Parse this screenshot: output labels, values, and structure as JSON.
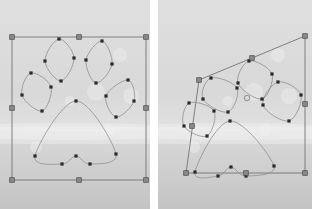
{
  "document": {
    "title": "Paw print path — free transform comparison",
    "canvas_width": 312,
    "canvas_height": 209,
    "panel_count": 2
  },
  "colors": {
    "background_sky": "#dcdcdc",
    "background_mid": "#d2d2d2",
    "background_snow": "#e8e8e8",
    "background_ground": "#c9c9c9",
    "page_gap": "#ffffff",
    "bounding_box_stroke": "#6e6e6e",
    "handle_fill": "#8a8a8a",
    "handle_stroke": "#4a4a4a",
    "path_stroke": "#8c8c8c",
    "anchor_fill": "#2a2a2a",
    "center_marker": "#9a9a9a"
  },
  "style": {
    "path_stroke_width": 0.8,
    "bbox_stroke_width": 1.0,
    "anchor_size": 3.2,
    "handle_size": 4.6
  },
  "panels": [
    {
      "id": "before",
      "label": "before-transform",
      "name": "original-paw-selection",
      "bbox_type": "axis-aligned-rectangle",
      "bbox_corners": [
        [
          12,
          37
        ],
        [
          146,
          37
        ],
        [
          146,
          180
        ],
        [
          12,
          180
        ]
      ],
      "bbox_handles": [
        {
          "name": "handle-top-left",
          "x": 12,
          "y": 37
        },
        {
          "name": "handle-top-center",
          "x": 79,
          "y": 37
        },
        {
          "name": "handle-top-right",
          "x": 146,
          "y": 37
        },
        {
          "name": "handle-middle-left",
          "x": 12,
          "y": 108
        },
        {
          "name": "handle-middle-right",
          "x": 146,
          "y": 108
        },
        {
          "name": "handle-bottom-left",
          "x": 12,
          "y": 180
        },
        {
          "name": "handle-bottom-center",
          "x": 79,
          "y": 180
        },
        {
          "name": "handle-bottom-right",
          "x": 146,
          "y": 180
        }
      ],
      "shapes": [
        {
          "name": "toe-inner-left",
          "type": "closed-bezier-ellipse",
          "cx": 59,
          "cy": 60,
          "rx": 14,
          "ry": 21,
          "rotation": -8,
          "anchors": [
            [
              59,
              39
            ],
            [
              45,
              61
            ],
            [
              61,
              81
            ],
            [
              74,
              58
            ]
          ]
        },
        {
          "name": "toe-inner-right",
          "type": "closed-bezier-ellipse",
          "cx": 98,
          "cy": 62,
          "rx": 14,
          "ry": 21,
          "rotation": 10,
          "anchors": [
            [
              102,
              41
            ],
            [
              86,
              60
            ],
            [
              96,
              83
            ],
            [
              112,
              64
            ]
          ]
        },
        {
          "name": "toe-outer-left",
          "type": "closed-bezier-ellipse",
          "cx": 37,
          "cy": 92,
          "rx": 13,
          "ry": 19,
          "rotation": -20,
          "anchors": [
            [
              31,
              73
            ],
            [
              22,
              95
            ],
            [
              42,
              111
            ],
            [
              51,
              87
            ]
          ]
        },
        {
          "name": "toe-outer-right",
          "type": "closed-bezier-ellipse",
          "cx": 120,
          "cy": 98,
          "rx": 13,
          "ry": 19,
          "rotation": 22,
          "anchors": [
            [
              128,
              80
            ],
            [
              106,
              96
            ],
            [
              116,
              117
            ],
            [
              134,
              101
            ]
          ]
        },
        {
          "name": "paw-pad",
          "type": "closed-bezier-heart-pad",
          "anchors": [
            [
              76,
              101
            ],
            [
              35,
              156
            ],
            [
              62,
              164
            ],
            [
              76,
              156
            ],
            [
              90,
              164
            ],
            [
              116,
              154
            ]
          ]
        }
      ],
      "anchor_count": 26
    },
    {
      "id": "after",
      "label": "after-transform",
      "name": "distorted-paw-selection",
      "bbox_type": "free-transform-quadrilateral",
      "bbox_corners": [
        [
          28,
          173
        ],
        [
          41,
          80
        ],
        [
          147,
          36
        ],
        [
          147,
          173
        ]
      ],
      "bbox_handles": [
        {
          "name": "handle-top-left",
          "x": 41,
          "y": 80
        },
        {
          "name": "handle-top-center",
          "x": 94,
          "y": 58
        },
        {
          "name": "handle-top-right",
          "x": 147,
          "y": 36
        },
        {
          "name": "handle-middle-left",
          "x": 34,
          "y": 126
        },
        {
          "name": "handle-middle-right",
          "x": 147,
          "y": 104
        },
        {
          "name": "handle-bottom-left",
          "x": 28,
          "y": 173
        },
        {
          "name": "handle-bottom-center",
          "x": 88,
          "y": 173
        },
        {
          "name": "handle-bottom-right",
          "x": 147,
          "y": 173
        }
      ],
      "shapes": [
        {
          "name": "toe-inner-left",
          "type": "closed-bezier-ellipse",
          "cx": 62,
          "cy": 95,
          "rx": 13,
          "ry": 19,
          "rotation": -28,
          "anchors": [
            [
              53,
              78
            ],
            [
              45,
              99
            ],
            [
              70,
              112
            ],
            [
              79,
              88
            ]
          ]
        },
        {
          "name": "toe-inner-right",
          "type": "closed-bezier-ellipse",
          "cx": 97,
          "cy": 80,
          "rx": 14,
          "ry": 20,
          "rotation": -22,
          "anchors": [
            [
              91,
              61
            ],
            [
              80,
              83
            ],
            [
              104,
              99
            ],
            [
              114,
              74
            ]
          ]
        },
        {
          "name": "toe-outer-left",
          "type": "closed-bezier-ellipse",
          "cx": 40,
          "cy": 119,
          "rx": 12,
          "ry": 18,
          "rotation": -34,
          "anchors": [
            [
              31,
              103
            ],
            [
              26,
              126
            ],
            [
              49,
              136
            ],
            [
              56,
              111
            ]
          ]
        },
        {
          "name": "toe-outer-right",
          "type": "closed-bezier-ellipse",
          "cx": 125,
          "cy": 101,
          "rx": 14,
          "ry": 19,
          "rotation": -28,
          "anchors": [
            [
              120,
              82
            ],
            [
              105,
              105
            ],
            [
              131,
              121
            ],
            [
              143,
              95
            ]
          ]
        },
        {
          "name": "paw-pad",
          "type": "closed-bezier-heart-pad",
          "anchors": [
            [
              72,
              121
            ],
            [
              37,
              172
            ],
            [
              60,
              176
            ],
            [
              73,
              167
            ],
            [
              88,
              176
            ],
            [
              116,
              166
            ]
          ]
        }
      ],
      "anchor_count": 26
    }
  ],
  "background": {
    "bands": [
      {
        "name": "sky-band",
        "y": 0,
        "height": 112,
        "color": "#dbdbdb"
      },
      {
        "name": "haze-band",
        "y": 112,
        "height": 18,
        "color": "#d6d6d6"
      },
      {
        "name": "snow-ridge",
        "y": 130,
        "height": 14,
        "color": "#e4e4e4"
      },
      {
        "name": "ground-band",
        "y": 144,
        "height": 65,
        "color": "#c6c6c6"
      }
    ],
    "bokeh_highlights": [
      {
        "x": 96,
        "y": 92,
        "r": 9
      },
      {
        "x": 120,
        "y": 55,
        "r": 7
      },
      {
        "x": 36,
        "y": 147,
        "r": 6
      },
      {
        "x": 131,
        "y": 96,
        "r": 8
      },
      {
        "x": 70,
        "y": 101,
        "r": 5
      },
      {
        "x": 108,
        "y": 130,
        "r": 6
      }
    ]
  }
}
